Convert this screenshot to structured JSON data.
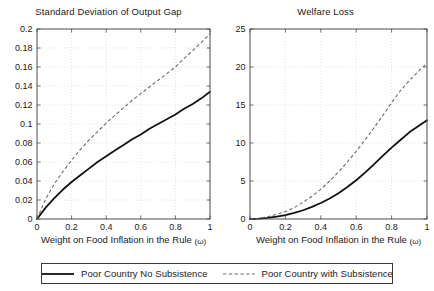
{
  "figure": {
    "background_color": "#ffffff",
    "axis_color": "#4d4d4d",
    "grid_color": "#d9d9d9"
  },
  "legend": {
    "entries": [
      {
        "label": "Poor Country No Subsistence",
        "style": "solid",
        "color": "#111111",
        "sample_name": "legend-sample-solid-line"
      },
      {
        "label": "Poor Country with Subsistence",
        "style": "dashed",
        "color": "#6b6b6b",
        "sample_name": "legend-sample-dashed-line"
      }
    ]
  },
  "chart_data": [
    {
      "type": "line",
      "title": "Standard Deviation of Output Gap",
      "xlabel": "Weight on Food Inflation in the Rule (ω)",
      "ylabel": "",
      "xlim": [
        0,
        1
      ],
      "ylim": [
        0,
        0.2
      ],
      "xticks": [
        0,
        0.2,
        0.4,
        0.6,
        0.8,
        1
      ],
      "xticklabels": [
        "0",
        "0.2",
        "0.4",
        "0.6",
        "0.8",
        "1"
      ],
      "yticks": [
        0,
        0.02,
        0.04,
        0.06,
        0.08,
        0.1,
        0.12,
        0.14,
        0.16,
        0.18,
        0.2
      ],
      "yticklabels": [
        "0",
        "0.02",
        "0.04",
        "0.06",
        "0.08",
        "0.1",
        "0.12",
        "0.14",
        "0.16",
        "0.18",
        "0.2"
      ],
      "grid": true,
      "legend_position": "below-figure",
      "x": [
        0,
        0.05,
        0.1,
        0.15,
        0.2,
        0.25,
        0.3,
        0.35,
        0.4,
        0.45,
        0.5,
        0.55,
        0.6,
        0.65,
        0.7,
        0.75,
        0.8,
        0.85,
        0.9,
        0.95,
        1
      ],
      "series": [
        {
          "name": "Poor Country No Subsistence",
          "style": "solid",
          "color": "#111111",
          "values": [
            0,
            0.012,
            0.022,
            0.031,
            0.039,
            0.046,
            0.053,
            0.06,
            0.066,
            0.072,
            0.078,
            0.084,
            0.089,
            0.095,
            0.1,
            0.105,
            0.11,
            0.116,
            0.121,
            0.127,
            0.134
          ]
        },
        {
          "name": "Poor Country with Subsistence",
          "style": "dashed",
          "color": "#6b6b6b",
          "values": [
            0,
            0.021,
            0.037,
            0.05,
            0.062,
            0.073,
            0.083,
            0.092,
            0.101,
            0.109,
            0.117,
            0.125,
            0.132,
            0.139,
            0.146,
            0.153,
            0.16,
            0.169,
            0.177,
            0.186,
            0.195
          ]
        }
      ]
    },
    {
      "type": "line",
      "title": "Welfare Loss",
      "xlabel": "Weight on Food Inflation in the Rule (ω)",
      "ylabel": "",
      "xlim": [
        0,
        1
      ],
      "ylim": [
        0,
        25
      ],
      "xticks": [
        0,
        0.2,
        0.4,
        0.6,
        0.8,
        1
      ],
      "xticklabels": [
        "0",
        "0.2",
        "0.4",
        "0.6",
        "0.8",
        "1"
      ],
      "yticks": [
        0,
        5,
        10,
        15,
        20,
        25
      ],
      "yticklabels": [
        "0",
        "5",
        "10",
        "15",
        "20",
        "25"
      ],
      "grid": true,
      "legend_position": "below-figure",
      "x": [
        0,
        0.05,
        0.1,
        0.15,
        0.2,
        0.25,
        0.3,
        0.35,
        0.4,
        0.45,
        0.5,
        0.55,
        0.6,
        0.65,
        0.7,
        0.75,
        0.8,
        0.85,
        0.9,
        0.95,
        1
      ],
      "series": [
        {
          "name": "Poor Country No Subsistence",
          "style": "solid",
          "color": "#111111",
          "values": [
            0,
            0.05,
            0.15,
            0.3,
            0.5,
            0.8,
            1.15,
            1.6,
            2.1,
            2.7,
            3.4,
            4.2,
            5.1,
            6.1,
            7.2,
            8.3,
            9.4,
            10.4,
            11.4,
            12.2,
            13.0
          ]
        },
        {
          "name": "Poor Country with Subsistence",
          "style": "dashed",
          "color": "#6b6b6b",
          "values": [
            0,
            0.1,
            0.3,
            0.6,
            1.0,
            1.5,
            2.2,
            3.0,
            3.9,
            5.0,
            6.2,
            7.5,
            8.9,
            10.4,
            12.0,
            13.6,
            15.3,
            16.9,
            18.2,
            19.4,
            20.5
          ]
        }
      ]
    }
  ]
}
